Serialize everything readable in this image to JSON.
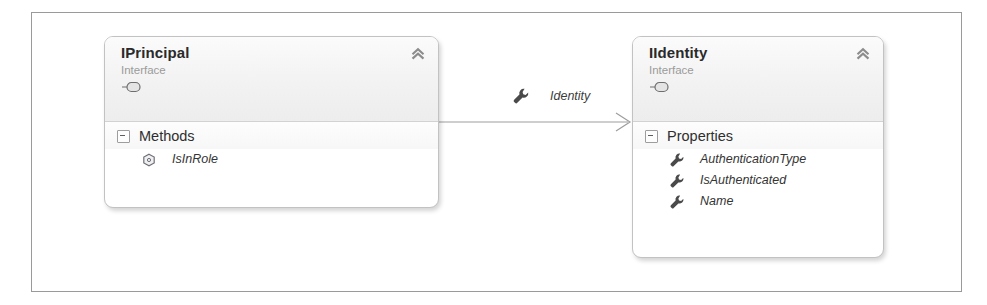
{
  "diagram": {
    "type": "uml-class-diagram",
    "frame_border_color": "#9a9a9a",
    "canvas_color": "#ffffff"
  },
  "connector": {
    "label": "Identity",
    "icon": "wrench-icon",
    "style": "association-open-arrow",
    "from": "IPrincipal",
    "to": "IIdentity",
    "line_color": "#9d9d9d"
  },
  "cards": [
    {
      "id": "iprincipal",
      "title": "IPrincipal",
      "stereotype": "Interface",
      "shape_icon": "interface-lollipop-icon",
      "collapse_icon": "chevron-double-up-icon",
      "sections": [
        {
          "label": "Methods",
          "expander": "collapse-minus-box",
          "members": [
            {
              "name": "IsInRole",
              "icon": "method-hexagon-icon"
            }
          ]
        }
      ]
    },
    {
      "id": "iidentity",
      "title": "IIdentity",
      "stereotype": "Interface",
      "shape_icon": "interface-lollipop-icon",
      "collapse_icon": "chevron-double-up-icon",
      "sections": [
        {
          "label": "Properties",
          "expander": "collapse-minus-box",
          "members": [
            {
              "name": "AuthenticationType",
              "icon": "property-wrench-icon"
            },
            {
              "name": "IsAuthenticated",
              "icon": "property-wrench-icon"
            },
            {
              "name": "Name",
              "icon": "property-wrench-icon"
            }
          ]
        }
      ]
    }
  ],
  "colors": {
    "title_text": "#2a2a2a",
    "stereotype_text": "#9b9b9b",
    "member_text": "#343434",
    "card_border": "#c2c2c2",
    "header_gradient_top": "#fbfbfb",
    "header_gradient_bottom": "#ededed"
  }
}
